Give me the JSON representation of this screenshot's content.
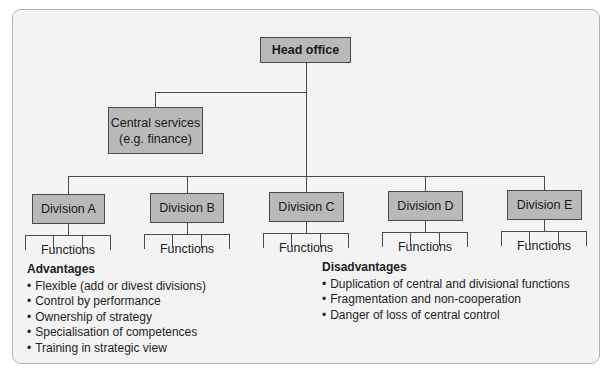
{
  "diagram": {
    "type": "organisation-chart",
    "structure": "multidivisional",
    "head": {
      "label": "Head office"
    },
    "central_services": {
      "line1": "Central services",
      "line2": "(e.g. finance)"
    },
    "divisions": [
      {
        "label": "Division A",
        "functions_label": "Functions"
      },
      {
        "label": "Division B",
        "functions_label": "Functions"
      },
      {
        "label": "Division C",
        "functions_label": "Functions"
      },
      {
        "label": "Division D",
        "functions_label": "Functions"
      },
      {
        "label": "Division E",
        "functions_label": "Functions"
      }
    ],
    "colors": {
      "box_fill": "#b9b9b9",
      "box_border": "#4a4a4a",
      "panel_background": "#f3f3f3",
      "panel_border": "#b5b5b5"
    }
  },
  "advantages": {
    "title": "Advantages",
    "items": [
      "Flexible (add or divest divisions)",
      "Control by performance",
      "Ownership of strategy",
      "Specialisation of competences",
      "Training in strategic view"
    ]
  },
  "disadvantages": {
    "title": "Disadvantages",
    "items": [
      "Duplication of central and divisional functions",
      "Fragmentation and non-cooperation",
      "Danger of loss of central control"
    ]
  }
}
